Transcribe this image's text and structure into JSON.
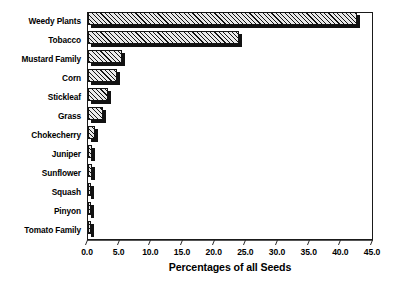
{
  "chart_data": {
    "type": "bar",
    "orientation": "horizontal",
    "title": "",
    "xlabel": "Percentages of all Seeds",
    "ylabel": "",
    "xlim": [
      0.0,
      45.0
    ],
    "xticks": [
      "0.0",
      "5.0",
      "10.0",
      "15.0",
      "20.0",
      "25.0",
      "30.0",
      "35.0",
      "40.0",
      "45.0"
    ],
    "xtick_values": [
      0,
      5,
      10,
      15,
      20,
      25,
      30,
      35,
      40,
      45
    ],
    "grid": false,
    "legend": null,
    "categories": [
      "Weedy Plants",
      "Tobacco",
      "Mustard Family",
      "Corn",
      "Stickleaf",
      "Grass",
      "Chokecherry",
      "Juniper",
      "Sunflower",
      "Squash",
      "Pinyon",
      "Tomato Family"
    ],
    "values": [
      42.5,
      23.8,
      5.3,
      4.6,
      3.1,
      2.3,
      1.1,
      0.7,
      0.6,
      0.5,
      0.4,
      0.4
    ],
    "bar_style": {
      "fill": "#e9e9e9",
      "hatch": "diagonal-45",
      "edge": "#131313",
      "shadow": "#121212"
    }
  }
}
